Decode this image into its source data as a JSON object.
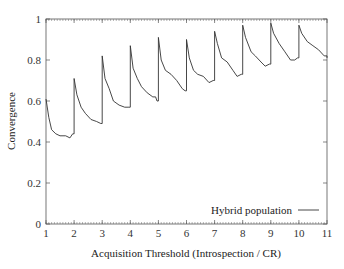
{
  "chart_data": {
    "type": "line",
    "title": "",
    "xlabel": "Acquisition Threshold (Introspection / CR)",
    "ylabel": "Convergence",
    "xlim": [
      1,
      11
    ],
    "ylim": [
      0,
      1
    ],
    "xticks": [
      1,
      2,
      3,
      4,
      5,
      6,
      7,
      8,
      9,
      10,
      11
    ],
    "yticks": [
      0,
      0.2,
      0.4,
      0.6,
      0.8,
      1
    ],
    "ytick_labels": [
      "0",
      "0.2",
      "0.4",
      "0.6",
      "0.8",
      "1"
    ],
    "grid": false,
    "legend_position": "lower right",
    "series": [
      {
        "name": "Hybrid population",
        "color": "#333333",
        "x": [
          1.0,
          1.1,
          1.2,
          1.35,
          1.5,
          1.7,
          1.85,
          1.95,
          2.0,
          2.1,
          2.25,
          2.4,
          2.6,
          2.8,
          2.95,
          3.0,
          3.1,
          3.25,
          3.4,
          3.6,
          3.8,
          3.95,
          4.0,
          4.1,
          4.25,
          4.4,
          4.6,
          4.8,
          4.9,
          4.95,
          5.0,
          5.1,
          5.25,
          5.45,
          5.65,
          5.85,
          5.95,
          6.0,
          6.1,
          6.25,
          6.4,
          6.6,
          6.8,
          6.95,
          7.0,
          7.1,
          7.25,
          7.45,
          7.65,
          7.8,
          7.95,
          8.0,
          8.1,
          8.3,
          8.45,
          8.65,
          8.8,
          8.95,
          9.0,
          9.1,
          9.3,
          9.5,
          9.7,
          9.85,
          9.95,
          10.0,
          10.1,
          10.3,
          10.5,
          10.7,
          10.9,
          11.0
        ],
        "y": [
          0.61,
          0.52,
          0.46,
          0.44,
          0.43,
          0.43,
          0.42,
          0.44,
          0.71,
          0.63,
          0.57,
          0.54,
          0.51,
          0.5,
          0.49,
          0.82,
          0.71,
          0.66,
          0.6,
          0.58,
          0.57,
          0.57,
          0.87,
          0.76,
          0.71,
          0.67,
          0.64,
          0.62,
          0.62,
          0.6,
          0.91,
          0.8,
          0.75,
          0.73,
          0.7,
          0.66,
          0.65,
          0.9,
          0.81,
          0.75,
          0.73,
          0.72,
          0.69,
          0.7,
          0.94,
          0.88,
          0.81,
          0.79,
          0.75,
          0.72,
          0.73,
          0.97,
          0.91,
          0.84,
          0.82,
          0.79,
          0.77,
          0.78,
          0.98,
          0.93,
          0.88,
          0.84,
          0.8,
          0.8,
          0.81,
          0.97,
          0.93,
          0.89,
          0.87,
          0.85,
          0.82,
          0.81
        ]
      }
    ]
  },
  "legend": {
    "label": "Hybrid population"
  }
}
